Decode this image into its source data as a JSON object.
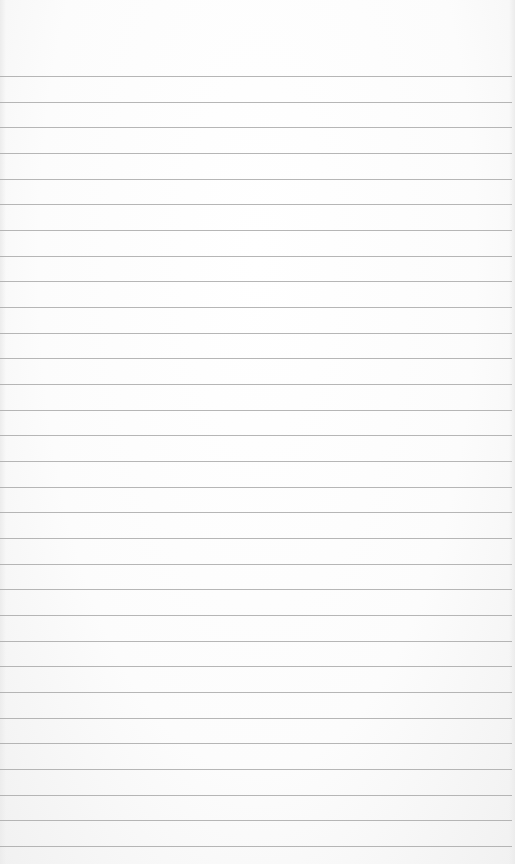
{
  "paper": {
    "background": "#fbfbfb",
    "rule_color": "#a9a9a9",
    "first_rule_y": 76,
    "rule_spacing": 25.67,
    "rule_count": 31
  }
}
